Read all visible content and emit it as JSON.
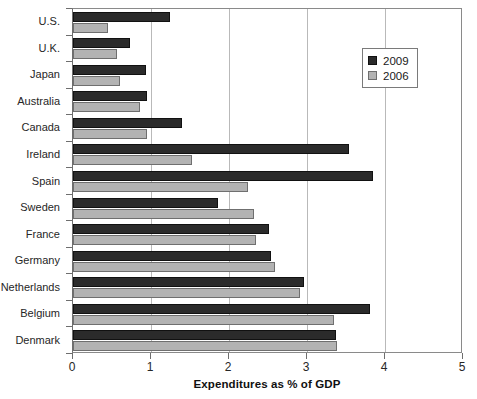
{
  "chart_data": {
    "type": "bar",
    "orientation": "horizontal",
    "title": "",
    "xlabel": "Expenditures as % of GDP",
    "ylabel": "",
    "xlim": [
      0,
      5
    ],
    "xticks": [
      "0",
      "1",
      "2",
      "3",
      "4",
      "5"
    ],
    "grid": "vertical",
    "legend_position": "top-right",
    "categories": [
      "U.S.",
      "U.K.",
      "Japan",
      "Australia",
      "Canada",
      "Ireland",
      "Spain",
      "Sweden",
      "France",
      "Germany",
      "Netherlands",
      "Belgium",
      "Denmark"
    ],
    "series": [
      {
        "name": "2009",
        "color": "#2b2b2b",
        "values": [
          1.24,
          0.73,
          0.94,
          0.95,
          1.4,
          3.54,
          3.85,
          1.86,
          2.51,
          2.54,
          2.96,
          3.81,
          3.37
        ]
      },
      {
        "name": "2006",
        "color": "#b3b3b3",
        "values": [
          0.45,
          0.57,
          0.6,
          0.86,
          0.95,
          1.53,
          2.24,
          2.32,
          2.35,
          2.59,
          2.91,
          3.34,
          3.38
        ]
      }
    ]
  },
  "legend": {
    "items": [
      {
        "label": "2009",
        "swatch": "dark-square-icon"
      },
      {
        "label": "2006",
        "swatch": "light-square-icon"
      }
    ]
  },
  "axis": {
    "x_title": "Expenditures as % of GDP"
  }
}
